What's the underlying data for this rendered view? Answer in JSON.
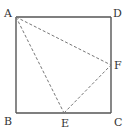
{
  "diagram": {
    "type": "geometry",
    "colors": {
      "solid": "#555555",
      "dashed": "#777777",
      "label": "#333333",
      "background": "#ffffff"
    },
    "points": {
      "A": {
        "label": "A",
        "x": 16,
        "y": 17,
        "lx": 4,
        "ly": 17
      },
      "D": {
        "label": "D",
        "x": 111,
        "y": 17,
        "lx": 113,
        "ly": 17
      },
      "B": {
        "label": "B",
        "x": 16,
        "y": 113,
        "lx": 4,
        "ly": 125
      },
      "C": {
        "label": "C",
        "x": 111,
        "y": 113,
        "lx": 114,
        "ly": 126
      },
      "E": {
        "label": "E",
        "x": 64,
        "y": 113,
        "lx": 61,
        "ly": 127
      },
      "F": {
        "label": "F",
        "x": 111,
        "y": 65,
        "lx": 114,
        "ly": 69
      }
    },
    "solid_segments": [
      [
        "A",
        "D"
      ],
      [
        "D",
        "C"
      ],
      [
        "C",
        "B"
      ],
      [
        "B",
        "A"
      ]
    ],
    "dashed_segments": [
      [
        "A",
        "E"
      ],
      [
        "A",
        "F"
      ],
      [
        "E",
        "F"
      ]
    ]
  }
}
